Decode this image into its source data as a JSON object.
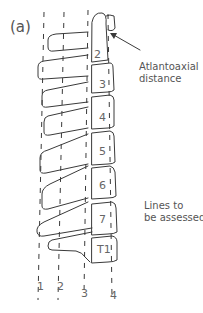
{
  "figure": {
    "panel_label": "(a)"
  },
  "vertebrae": [
    {
      "label": "2"
    },
    {
      "label": "3"
    },
    {
      "label": "4"
    },
    {
      "label": "5"
    },
    {
      "label": "6"
    },
    {
      "label": "7"
    },
    {
      "label": "T1"
    }
  ],
  "annotations": {
    "atlantoaxial_line1": "Atlantoaxial",
    "atlantoaxial_line2": "distance",
    "lines_line1": "Lines to",
    "lines_line2": "be assessed"
  },
  "lines": [
    {
      "label": "1"
    },
    {
      "label": "2"
    },
    {
      "label": "3"
    },
    {
      "label": "4"
    }
  ],
  "colors": {
    "stroke": "#3a3a3a",
    "text": "#555555",
    "background": "#ffffff"
  }
}
